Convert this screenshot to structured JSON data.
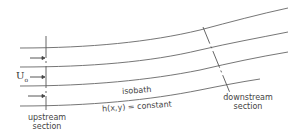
{
  "diagram": {
    "type": "isobath flow schematic",
    "velocity_label": "U",
    "velocity_subscript": "o",
    "isobath_label": "isobath",
    "depth_equation": "h(x,y) = constant",
    "upstream_label_line1": "upstream",
    "upstream_label_line2": "section",
    "downstream_label_line1": "downstream",
    "downstream_label_line2": "section",
    "isobath_count": 4,
    "arrow_count": 3,
    "line_color": "#555555"
  }
}
